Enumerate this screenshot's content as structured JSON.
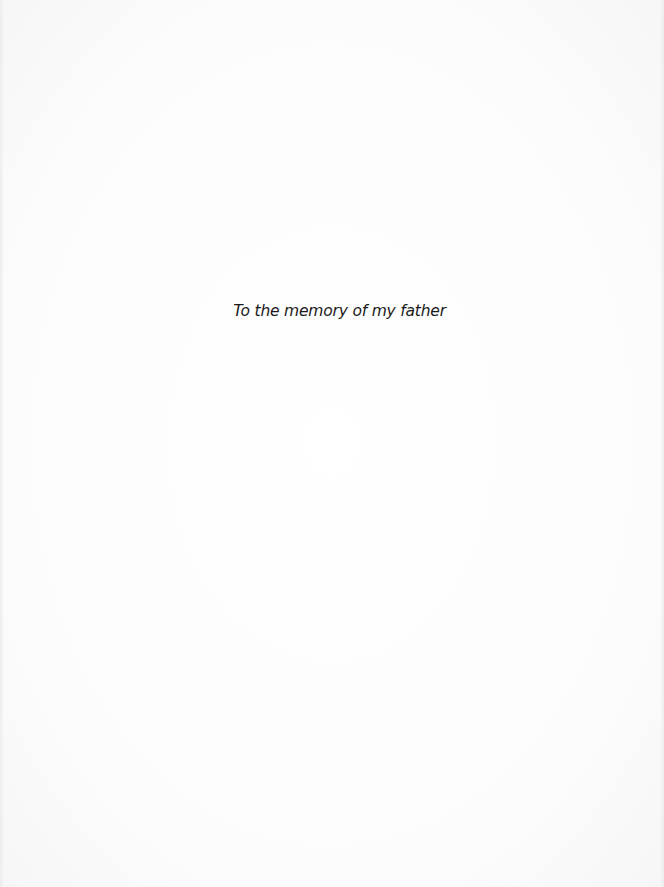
{
  "page": {
    "type": "dedication",
    "dedication_text": "To the memory of my father"
  },
  "colors": {
    "paper": "#fdfdfd",
    "text": "#1a1a1a"
  }
}
